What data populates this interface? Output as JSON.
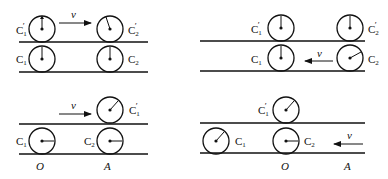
{
  "diagram": {
    "panels": [
      {
        "id": "panel-a",
        "velocity_label": "v",
        "velocity_direction": "right",
        "wheels": [
          {
            "label": "C1'",
            "main": "C",
            "sub": "1",
            "prime": "′"
          },
          {
            "label": "C2'",
            "main": "C",
            "sub": "2",
            "prime": "′"
          },
          {
            "label": "C1",
            "main": "C",
            "sub": "1",
            "prime": ""
          },
          {
            "label": "C2",
            "main": "C",
            "sub": "2",
            "prime": ""
          }
        ]
      },
      {
        "id": "panel-b",
        "velocity_label": "v",
        "velocity_direction": "left",
        "wheels": [
          {
            "label": "C1'",
            "main": "C",
            "sub": "1",
            "prime": "′"
          },
          {
            "label": "C2'",
            "main": "C",
            "sub": "2",
            "prime": "′"
          },
          {
            "label": "C1",
            "main": "C",
            "sub": "1",
            "prime": ""
          },
          {
            "label": "C2",
            "main": "C",
            "sub": "2",
            "prime": ""
          }
        ]
      },
      {
        "id": "panel-c",
        "velocity_label": "v",
        "velocity_direction": "right",
        "wheels": [
          {
            "label": "C1'",
            "main": "C",
            "sub": "1",
            "prime": "′"
          },
          {
            "label": "C1",
            "main": "C",
            "sub": "1",
            "prime": ""
          },
          {
            "label": "C2",
            "main": "C",
            "sub": "2",
            "prime": ""
          }
        ],
        "points": [
          {
            "label": "O"
          },
          {
            "label": "A"
          }
        ]
      },
      {
        "id": "panel-d",
        "velocity_label": "v",
        "velocity_direction": "left",
        "wheels": [
          {
            "label": "C1'",
            "main": "C",
            "sub": "1",
            "prime": "′"
          },
          {
            "label": "C1",
            "main": "C",
            "sub": "1",
            "prime": ""
          },
          {
            "label": "C2",
            "main": "C",
            "sub": "2",
            "prime": ""
          }
        ],
        "points": [
          {
            "label": "O"
          },
          {
            "label": "A"
          }
        ]
      }
    ]
  }
}
